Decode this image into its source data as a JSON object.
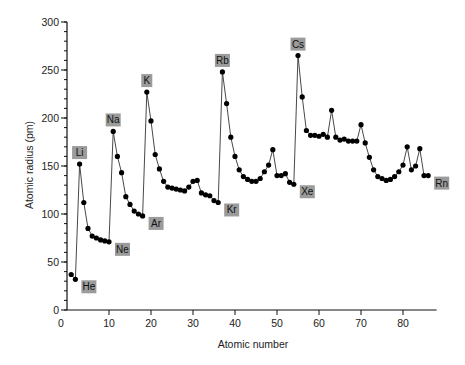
{
  "chart_data": {
    "type": "line",
    "title": "",
    "xlabel": "Atomic number",
    "ylabel": "Atomic radius (pm)",
    "xlim": [
      0,
      88
    ],
    "ylim": [
      0,
      300
    ],
    "xticks": [
      0,
      10,
      20,
      30,
      40,
      50,
      60,
      70,
      80
    ],
    "yticks": [
      0,
      50,
      100,
      150,
      200,
      250,
      300
    ],
    "y_minor_step": 10,
    "grid": false,
    "legend": null,
    "marker": "filled-circle",
    "series": [
      {
        "name": "Atomic radius",
        "x": [
          1,
          2,
          3,
          4,
          5,
          6,
          7,
          8,
          9,
          10,
          11,
          12,
          13,
          14,
          15,
          16,
          17,
          18,
          19,
          20,
          21,
          22,
          23,
          24,
          25,
          26,
          27,
          28,
          29,
          30,
          31,
          32,
          33,
          34,
          35,
          36,
          37,
          38,
          39,
          40,
          41,
          42,
          43,
          44,
          45,
          46,
          47,
          48,
          49,
          50,
          51,
          52,
          53,
          54,
          55,
          56,
          57,
          58,
          59,
          60,
          61,
          62,
          63,
          64,
          65,
          66,
          67,
          68,
          69,
          70,
          71,
          72,
          73,
          74,
          75,
          76,
          77,
          78,
          79,
          80,
          81,
          82,
          83,
          84,
          85,
          86
        ],
        "values": [
          37,
          32,
          152,
          112,
          85,
          77,
          75,
          73,
          72,
          71,
          186,
          160,
          143,
          118,
          110,
          103,
          100,
          98,
          227,
          197,
          162,
          147,
          134,
          128,
          127,
          126,
          125,
          124,
          128,
          134,
          135,
          122,
          120,
          119,
          114,
          112,
          248,
          215,
          180,
          160,
          146,
          139,
          136,
          134,
          134,
          137,
          144,
          151,
          167,
          140,
          140,
          142,
          133,
          131,
          265,
          222,
          187,
          182,
          182,
          181,
          183,
          180,
          208,
          180,
          177,
          178,
          176,
          176,
          176,
          193,
          174,
          159,
          146,
          139,
          137,
          135,
          136,
          139,
          144,
          151,
          170,
          146,
          150,
          168,
          140,
          140
        ]
      }
    ],
    "annotations": [
      {
        "text": "He",
        "x": 2
      },
      {
        "text": "Li",
        "x": 3
      },
      {
        "text": "Ne",
        "x": 10
      },
      {
        "text": "Na",
        "x": 11
      },
      {
        "text": "Ar",
        "x": 18
      },
      {
        "text": "K",
        "x": 19
      },
      {
        "text": "Kr",
        "x": 36
      },
      {
        "text": "Rb",
        "x": 37
      },
      {
        "text": "Xe",
        "x": 54
      },
      {
        "text": "Cs",
        "x": 55
      },
      {
        "text": "Rn",
        "x": 86
      }
    ],
    "label_style": {
      "box_color": "#9b9b9b",
      "text_color": "#111111"
    },
    "line_color": "#333333",
    "marker_color": "#000000"
  }
}
